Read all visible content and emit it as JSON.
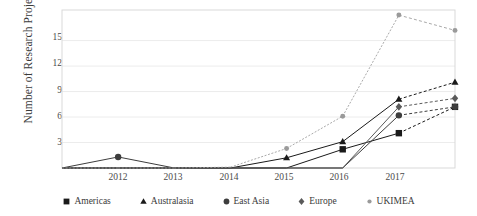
{
  "chart_data": {
    "type": "line",
    "title": "",
    "xlabel": "",
    "ylabel": "Number of Research Projects",
    "x": [
      "2011",
      "2012",
      "2013",
      "2014",
      "2015",
      "2016",
      "2017",
      "2018"
    ],
    "xtick_labels": [
      "2012",
      "2013",
      "2014",
      "2015",
      "2016",
      "2017"
    ],
    "ytick_labels": [
      "3",
      "6",
      "9",
      "12",
      "15"
    ],
    "ytick_values": [
      3,
      6,
      9,
      12,
      15
    ],
    "ylim": [
      0,
      18.6
    ],
    "grid": "horizontal",
    "legend_position": "bottom",
    "series": [
      {
        "name": "Americas",
        "marker": "square",
        "color": "#1a1a1a",
        "values": [
          0,
          0,
          0,
          0,
          0,
          2.2,
          4.1,
          7.2
        ]
      },
      {
        "name": "Australasia",
        "marker": "triangle",
        "color": "#1a1a1a",
        "values": [
          0,
          0,
          0,
          0,
          1.2,
          3.1,
          8.1,
          10.1
        ]
      },
      {
        "name": "East Asia",
        "marker": "circle",
        "color": "#3d3d3d",
        "values": [
          0,
          1.3,
          0,
          0,
          0,
          0,
          6.2,
          7.2
        ]
      },
      {
        "name": "Europe",
        "marker": "diamond",
        "color": "#5a5a5a",
        "values": [
          0,
          0,
          0,
          0,
          0,
          0,
          7.2,
          8.2
        ]
      },
      {
        "name": "UKIMEA",
        "marker": "dot",
        "color": "#9a9a9a",
        "values": [
          0,
          0,
          0,
          0.1,
          2.3,
          6.1,
          18.0,
          16.2
        ]
      }
    ]
  },
  "legend": {
    "items": [
      {
        "label": "Americas",
        "marker": "square-marker"
      },
      {
        "label": "Australasia",
        "marker": "triangle-marker"
      },
      {
        "label": "East Asia",
        "marker": "circle-marker"
      },
      {
        "label": "Europe",
        "marker": "diamond-marker"
      },
      {
        "label": "UKIMEA",
        "marker": "dot-marker"
      }
    ]
  },
  "axes": {
    "y_title": "Number of Research Projects"
  },
  "colors": {
    "plot_border": "#d9d9d9",
    "gridline": "#ececec",
    "text": "#3a3a3a"
  }
}
